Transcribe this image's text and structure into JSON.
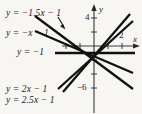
{
  "figure": {
    "background_color": "#f7f6f3",
    "ink_color": "#151515",
    "width": 142,
    "height": 114
  },
  "axes": {
    "x_axis_label": "x",
    "y_axis_label": "y",
    "origin_px": {
      "x": 94,
      "y": 46
    },
    "unit_px": {
      "x": 14,
      "y": 7
    },
    "x_ticks": [
      {
        "value": 2,
        "label": "2",
        "show_label": true
      },
      {
        "value": 1,
        "label": "1",
        "show_label": false
      },
      {
        "value": -1,
        "label": "-1",
        "show_label": false
      },
      {
        "value": -2,
        "label": "-2",
        "show_label": false
      }
    ],
    "y_ticks": [
      {
        "value": 4,
        "label": "4",
        "show_label": true
      },
      {
        "value": 2,
        "label": "2",
        "show_label": false
      },
      {
        "value": -2,
        "label": "-2",
        "show_label": false
      },
      {
        "value": -4,
        "label": "-4",
        "show_label": false
      },
      {
        "value": -6,
        "label": "−6",
        "show_label": true
      }
    ]
  },
  "labels": {
    "tick_y_4": "4",
    "tick_y_neg6": "−6",
    "tick_x_2": "2",
    "axis_x": "x",
    "axis_y": "y"
  },
  "equations": [
    {
      "id": "line-neg15x-1",
      "text": "y = −1.5x − 1",
      "slope": -1.5,
      "intercept": -1,
      "label_x": 6,
      "label_y": 9,
      "has_leader": true
    },
    {
      "id": "line-negx-1",
      "text": "y = −x − 1",
      "slope": -1,
      "intercept": -1,
      "label_x": 6,
      "label_y": 29,
      "has_leader": false
    },
    {
      "id": "line-const-neg1",
      "text": "y = −1",
      "slope": 0,
      "intercept": -1,
      "label_x": 17,
      "label_y": 48,
      "has_leader": false
    },
    {
      "id": "line-2x-1",
      "text": "y = 2x − 1",
      "slope": 2,
      "intercept": -1,
      "label_x": 6,
      "label_y": 85,
      "has_leader": false
    },
    {
      "id": "line-25x-1",
      "text": "y = 2.5x − 1",
      "slope": 2.5,
      "intercept": -1,
      "label_x": 6,
      "label_y": 96,
      "has_leader": false
    }
  ],
  "chart_data": {
    "type": "line",
    "title": "",
    "xlabel": "x",
    "ylabel": "y",
    "xlim": [
      -6.7,
      3.4
    ],
    "ylim": [
      -9.7,
      6.6
    ],
    "grid": false,
    "legend": "inline-left-labels",
    "common_point": {
      "x": 0,
      "y": -1
    },
    "annotations": [
      "leader arrow from 'y = -1.5x - 1' label to its line"
    ],
    "series": [
      {
        "name": "y = -1.5x - 1",
        "slope": -1.5,
        "intercept": -1,
        "points": [
          [
            -4.2,
            5.3
          ],
          [
            2.8,
            -5.2
          ]
        ]
      },
      {
        "name": "y = -x - 1",
        "slope": -1,
        "intercept": -1,
        "points": [
          [
            -4.2,
            3.2
          ],
          [
            2.8,
            -3.8
          ]
        ]
      },
      {
        "name": "y = -1",
        "slope": 0,
        "intercept": -1,
        "points": [
          [
            -5.4,
            -1
          ],
          [
            2.9,
            -1
          ]
        ]
      },
      {
        "name": "y = 2x - 1",
        "slope": 2,
        "intercept": -1,
        "points": [
          [
            -2.6,
            -6.2
          ],
          [
            2.8,
            4.6
          ]
        ]
      },
      {
        "name": "y = 2.5x - 1",
        "slope": 2.5,
        "intercept": -1,
        "points": [
          [
            -2.2,
            -6.5
          ],
          [
            2.55,
            5.4
          ]
        ]
      }
    ]
  }
}
